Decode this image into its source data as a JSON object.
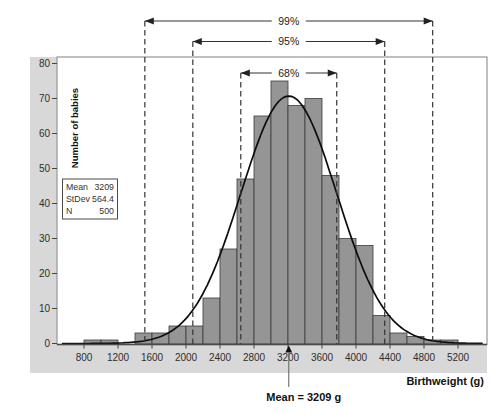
{
  "figure": {
    "y_axis_title": "Number of babies",
    "x_axis_title": "Birthweight (g)",
    "mean_annotation": "Mean = 3209 g",
    "stats_box": {
      "rows": [
        {
          "label": "Mean",
          "value": "3209"
        },
        {
          "label": "StDev",
          "value": "564.4"
        },
        {
          "label": "N",
          "value": "500"
        }
      ]
    }
  },
  "chart_data": {
    "type": "bar",
    "subtype": "histogram-with-normal-curve",
    "title": "",
    "xlabel": "Birthweight (g)",
    "ylabel": "Number of babies",
    "xlim": [
      480,
      5550
    ],
    "ylim": [
      0,
      80
    ],
    "grid": false,
    "x_ticks": [
      800,
      1200,
      1600,
      2000,
      2400,
      2800,
      3200,
      3600,
      4000,
      4400,
      4800,
      5200
    ],
    "y_ticks": [
      0,
      10,
      20,
      30,
      40,
      50,
      60,
      70,
      80
    ],
    "bin_width": 200,
    "bins": [
      {
        "start": 800,
        "count": 1
      },
      {
        "start": 1000,
        "count": 1
      },
      {
        "start": 1200,
        "count": 0
      },
      {
        "start": 1400,
        "count": 3
      },
      {
        "start": 1600,
        "count": 3
      },
      {
        "start": 1800,
        "count": 5
      },
      {
        "start": 2000,
        "count": 5
      },
      {
        "start": 2200,
        "count": 13
      },
      {
        "start": 2400,
        "count": 27
      },
      {
        "start": 2600,
        "count": 47
      },
      {
        "start": 2800,
        "count": 65
      },
      {
        "start": 3000,
        "count": 75
      },
      {
        "start": 3200,
        "count": 68
      },
      {
        "start": 3400,
        "count": 70
      },
      {
        "start": 3600,
        "count": 48
      },
      {
        "start": 3800,
        "count": 30
      },
      {
        "start": 4000,
        "count": 28
      },
      {
        "start": 4200,
        "count": 8
      },
      {
        "start": 4400,
        "count": 3
      },
      {
        "start": 4600,
        "count": 2
      },
      {
        "start": 4800,
        "count": 1
      },
      {
        "start": 5000,
        "count": 1
      }
    ],
    "normal_curve": {
      "mean": 3209,
      "stdev": 564.4,
      "n": 500,
      "peak_height": 70.7
    },
    "intervals": [
      {
        "label": "68%",
        "sigma": 1,
        "low": 2644.6,
        "high": 3773.4
      },
      {
        "label": "95%",
        "sigma": 2,
        "low": 2080.2,
        "high": 4337.8
      },
      {
        "label": "99%",
        "sigma": 3,
        "low": 1515.8,
        "high": 4902.2
      }
    ]
  },
  "colors": {
    "band": "#d8d8d8",
    "bar_fill": "#959595",
    "bar_edge": "#3c3c3c",
    "frame": "#979797",
    "curve": "#0d0d0d",
    "dashed": "#333333",
    "tick_text": "#2e2e2e",
    "title_text": "#111111",
    "plot_bg": "#ffffff"
  }
}
